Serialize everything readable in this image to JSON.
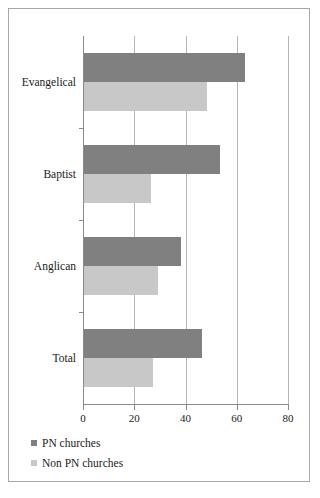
{
  "chart_data": {
    "type": "bar",
    "orientation": "horizontal",
    "title": "",
    "subtitle": "",
    "xlabel": "",
    "ylabel": "",
    "categories": [
      "Evangelical",
      "Baptist",
      "Anglican",
      "Total"
    ],
    "series": [
      {
        "name": "PN churches",
        "color": "#808080",
        "values": [
          63,
          53,
          38,
          46
        ]
      },
      {
        "name": "Non PN churches",
        "color": "#c8c8c8",
        "values": [
          48,
          26,
          29,
          27
        ]
      }
    ],
    "xlim": [
      0,
      80
    ],
    "xticks": [
      0,
      20,
      40,
      60,
      80
    ],
    "xtick_labels": [
      "0",
      "20",
      "40",
      "60",
      "80"
    ],
    "grid": true,
    "grid_axis": "x",
    "legend_position": "bottom-left",
    "annotations": []
  },
  "legend": {
    "entries": [
      {
        "label": "PN churches",
        "color": "#808080"
      },
      {
        "label": "Non PN churches",
        "color": "#c8c8c8"
      }
    ]
  },
  "axis": {
    "x_labels": [
      "0",
      "20",
      "40",
      "60",
      "80"
    ]
  },
  "categories": {
    "labels": [
      "Evangelical",
      "Baptist",
      "Anglican",
      "Total"
    ]
  }
}
